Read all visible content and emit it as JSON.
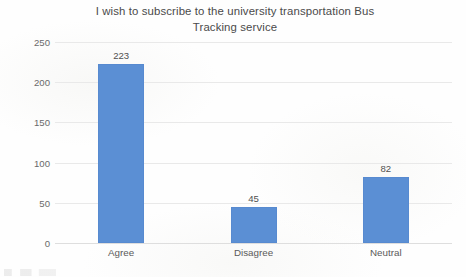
{
  "chart_data": {
    "type": "bar",
    "title": "I wish to subscribe to the university transportation Bus\nTracking service",
    "categories": [
      "Agree",
      "Disagree",
      "Neutral"
    ],
    "values": [
      223,
      45,
      82
    ],
    "xlabel": "",
    "ylabel": "",
    "ylim": [
      0,
      250
    ],
    "yticks": [
      0,
      50,
      100,
      150,
      200,
      250
    ],
    "ytick_labels": [
      "0",
      "50",
      "100",
      "150",
      "200",
      "250"
    ],
    "value_labels": [
      "223",
      "45",
      "82"
    ],
    "grid": true,
    "grid_axis": "y",
    "legend": false,
    "bar_color": "#5b8fd4",
    "grid_color": "#e9e9e9",
    "title_color": "#4a4a4a",
    "tick_color": "#6a6a6a"
  }
}
